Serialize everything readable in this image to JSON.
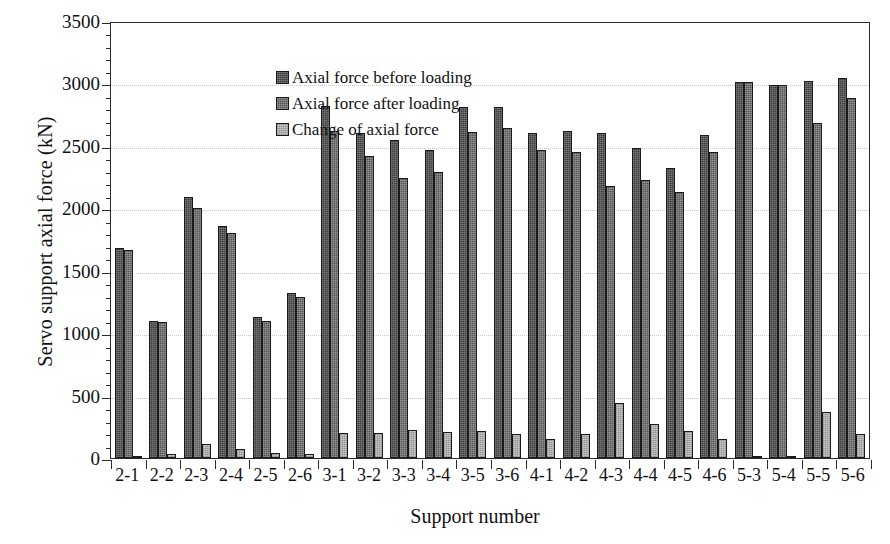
{
  "chart_data": {
    "type": "bar",
    "title": "",
    "xlabel": "Support number",
    "ylabel": "Servo support axial force (kN)",
    "ylim": [
      0,
      3500
    ],
    "ytick_step": 500,
    "yticks": [
      "0",
      "500",
      "1000",
      "1500",
      "2000",
      "2500",
      "3000",
      "3500"
    ],
    "grid": "horizontal-dotted",
    "legend_position": "top-left-inside",
    "categories": [
      "2-1",
      "2-2",
      "2-3",
      "2-4",
      "2-5",
      "2-6",
      "3-1",
      "3-2",
      "3-3",
      "3-4",
      "3-5",
      "3-6",
      "4-1",
      "4-2",
      "4-3",
      "4-4",
      "4-5",
      "4-6",
      "5-3",
      "5-4",
      "5-5",
      "5-6"
    ],
    "series": [
      {
        "name": "Axial force before loading",
        "color": "#3d3d3d",
        "values": [
          1680,
          1100,
          2090,
          1860,
          1130,
          1320,
          2820,
          2600,
          2550,
          2470,
          2810,
          2810,
          2600,
          2620,
          2600,
          2480,
          2320,
          2590,
          3010,
          2990,
          3020,
          3040
        ]
      },
      {
        "name": "Axial force after loading",
        "color": "#555555",
        "values": [
          1670,
          1090,
          2000,
          1800,
          1100,
          1290,
          2620,
          2420,
          2240,
          2290,
          2610,
          2640,
          2470,
          2450,
          2180,
          2230,
          2130,
          2450,
          3010,
          2990,
          2680,
          2880
        ]
      },
      {
        "name": "Change of axial force",
        "color": "#c9c9c9",
        "values": [
          15,
          30,
          110,
          75,
          40,
          35,
          200,
          200,
          225,
          210,
          215,
          195,
          150,
          190,
          440,
          270,
          215,
          150,
          5,
          5,
          370,
          190
        ]
      }
    ]
  }
}
